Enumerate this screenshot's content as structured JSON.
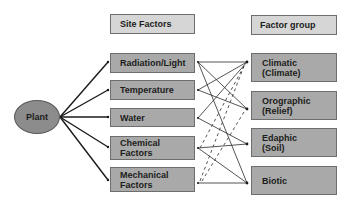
{
  "diagram": {
    "center_node": {
      "label": "Plant"
    },
    "headers": {
      "site_factors": "Site Factors",
      "factor_group": "Factor group"
    },
    "site_factors": [
      {
        "id": "radiation",
        "lines": [
          "Radiation/Light"
        ]
      },
      {
        "id": "temperature",
        "lines": [
          "Temperature"
        ]
      },
      {
        "id": "water",
        "lines": [
          "Water"
        ]
      },
      {
        "id": "chemical",
        "lines": [
          "Chemical",
          "Factors"
        ]
      },
      {
        "id": "mechanical",
        "lines": [
          "Mechanical",
          "Factors"
        ]
      }
    ],
    "factor_groups": [
      {
        "id": "climatic",
        "lines": [
          "Climatic",
          "(Climate)"
        ]
      },
      {
        "id": "orographic",
        "lines": [
          "Orographic",
          "(Relief)"
        ]
      },
      {
        "id": "edaphic",
        "lines": [
          "Edaphic",
          "(Soil)"
        ]
      },
      {
        "id": "biotic",
        "lines": [
          "Biotic"
        ]
      }
    ],
    "connections_solid": [
      [
        "climatic",
        "radiation"
      ],
      [
        "orographic",
        "radiation"
      ],
      [
        "biotic",
        "radiation"
      ],
      [
        "climatic",
        "temperature"
      ],
      [
        "orographic",
        "temperature"
      ],
      [
        "climatic",
        "water"
      ],
      [
        "edaphic",
        "water"
      ],
      [
        "edaphic",
        "chemical"
      ],
      [
        "biotic",
        "chemical"
      ],
      [
        "biotic",
        "mechanical"
      ]
    ],
    "connections_dashed": [
      [
        "climatic",
        "chemical"
      ],
      [
        "climatic",
        "mechanical"
      ],
      [
        "orographic",
        "mechanical"
      ]
    ],
    "colors": {
      "header_fill": "#d6d6d6",
      "box_fill": "#a9a9a9",
      "plant_fill": "#8c8c8c",
      "line": "#1a1a1a"
    }
  }
}
